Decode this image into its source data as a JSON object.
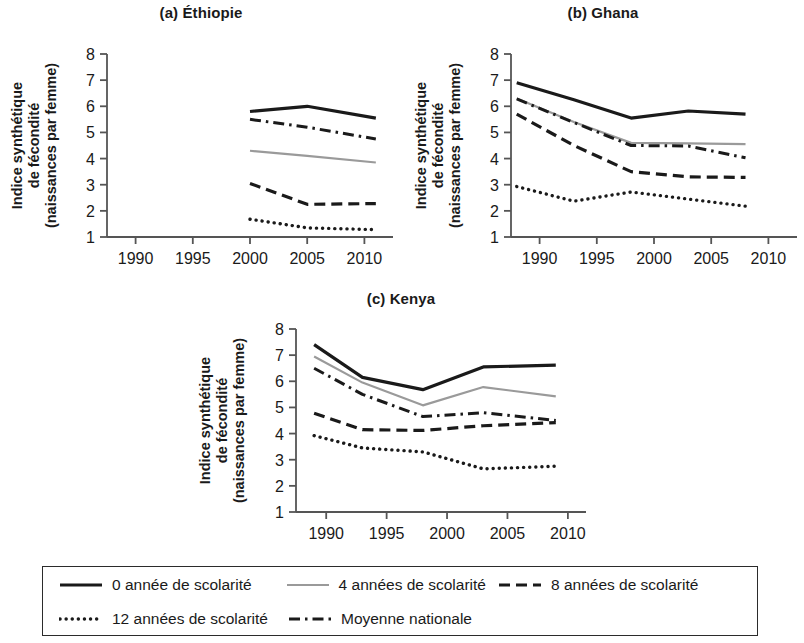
{
  "figure": {
    "y_axis_label_line1": "Indice synthétique",
    "y_axis_label_line2": "de fécondité",
    "y_axis_label_line3": "(naissances par femme)"
  },
  "legend": {
    "rows": [
      [
        {
          "style": "solid-black",
          "label": "0 année de scolarité"
        },
        {
          "style": "solid-gray",
          "label": "4 années de scolarité"
        },
        {
          "style": "dashed",
          "label": "8 années de scolarité"
        }
      ],
      [
        {
          "style": "dotted",
          "label": "12 années de scolarité"
        },
        {
          "style": "dashdot",
          "label": "Moyenne nationale"
        }
      ]
    ]
  },
  "chart_data": [
    {
      "type": "line",
      "panel": "a",
      "title": "(a) Éthiopie",
      "xlabel": "",
      "ylabel": "Indice synthétique de fécondité (naissances par femme)",
      "xlim": [
        1987.5,
        2012.5
      ],
      "ylim": [
        1,
        8
      ],
      "xticks": [
        1990,
        1995,
        2000,
        2005,
        2010
      ],
      "yticks": [
        1,
        2,
        3,
        4,
        5,
        6,
        7,
        8
      ],
      "grid": false,
      "series": [
        {
          "name": "0 année de scolarité",
          "style": "solid-black",
          "x": [
            2000,
            2005,
            2011
          ],
          "values": [
            5.8,
            6.0,
            5.55
          ]
        },
        {
          "name": "4 années de scolarité",
          "style": "solid-gray",
          "x": [
            2000,
            2005,
            2011
          ],
          "values": [
            4.3,
            4.1,
            3.85
          ]
        },
        {
          "name": "8 années de scolarité",
          "style": "dashed",
          "x": [
            2000,
            2005,
            2011
          ],
          "values": [
            3.05,
            2.25,
            2.28
          ]
        },
        {
          "name": "12 années de scolarité",
          "style": "dotted",
          "x": [
            2000,
            2005,
            2011
          ],
          "values": [
            1.68,
            1.35,
            1.28
          ]
        },
        {
          "name": "Moyenne nationale",
          "style": "dashdot",
          "x": [
            2000,
            2005,
            2011
          ],
          "values": [
            5.5,
            5.2,
            4.75
          ]
        }
      ]
    },
    {
      "type": "line",
      "panel": "b",
      "title": "(b) Ghana",
      "xlabel": "",
      "ylabel": "Indice synthétique de fécondité (naissances par femme)",
      "xlim": [
        1987.5,
        2012.5
      ],
      "ylim": [
        1,
        8
      ],
      "xticks": [
        1990,
        1995,
        2000,
        2005,
        2010
      ],
      "yticks": [
        1,
        2,
        3,
        4,
        5,
        6,
        7,
        8
      ],
      "grid": false,
      "series": [
        {
          "name": "0 année de scolarité",
          "style": "solid-black",
          "x": [
            1988,
            1993,
            1998,
            2003,
            2008
          ],
          "values": [
            6.9,
            6.25,
            5.55,
            5.82,
            5.7
          ]
        },
        {
          "name": "4 années de scolarité",
          "style": "solid-gray",
          "x": [
            1988,
            1993,
            1998,
            2003,
            2008
          ],
          "values": [
            6.3,
            5.4,
            4.6,
            4.58,
            4.55
          ]
        },
        {
          "name": "8 années de scolarité",
          "style": "dashed",
          "x": [
            1988,
            1993,
            1998,
            2003,
            2008
          ],
          "values": [
            5.7,
            4.5,
            3.5,
            3.3,
            3.28
          ]
        },
        {
          "name": "12 années de scolarité",
          "style": "dotted",
          "x": [
            1988,
            1993,
            1998,
            2003,
            2008
          ],
          "values": [
            2.93,
            2.37,
            2.72,
            2.45,
            2.18
          ]
        },
        {
          "name": "Moyenne nationale",
          "style": "dashdot",
          "x": [
            1988,
            1993,
            1998,
            2003,
            2008
          ],
          "values": [
            6.28,
            5.38,
            4.5,
            4.48,
            4.03
          ]
        }
      ]
    },
    {
      "type": "line",
      "panel": "c",
      "title": "(c) Kenya",
      "xlabel": "",
      "ylabel": "Indice synthétique de fécondité (naissances par femme)",
      "xlim": [
        1987.5,
        2011.5
      ],
      "ylim": [
        1,
        8
      ],
      "xticks": [
        1990,
        1995,
        2000,
        2005,
        2010
      ],
      "yticks": [
        1,
        2,
        3,
        4,
        5,
        6,
        7,
        8
      ],
      "grid": false,
      "series": [
        {
          "name": "0 année de scolarité",
          "style": "solid-black",
          "x": [
            1989,
            1993,
            1998,
            2003,
            2009
          ],
          "values": [
            7.4,
            6.15,
            5.68,
            6.55,
            6.62
          ]
        },
        {
          "name": "4 années de scolarité",
          "style": "solid-gray",
          "x": [
            1989,
            1993,
            1998,
            2003,
            2009
          ],
          "values": [
            6.95,
            5.95,
            5.08,
            5.78,
            5.42
          ]
        },
        {
          "name": "8 années de scolarité",
          "style": "dashed",
          "x": [
            1989,
            1993,
            1998,
            2003,
            2009
          ],
          "values": [
            4.78,
            4.15,
            4.12,
            4.3,
            4.42
          ]
        },
        {
          "name": "12 années de scolarité",
          "style": "dotted",
          "x": [
            1989,
            1993,
            1998,
            2003,
            2009
          ],
          "values": [
            3.92,
            3.45,
            3.3,
            2.65,
            2.75
          ]
        },
        {
          "name": "Moyenne nationale",
          "style": "dashdot",
          "x": [
            1989,
            1993,
            1998,
            2003,
            2009
          ],
          "values": [
            6.5,
            5.5,
            4.65,
            4.8,
            4.5
          ]
        }
      ]
    }
  ]
}
